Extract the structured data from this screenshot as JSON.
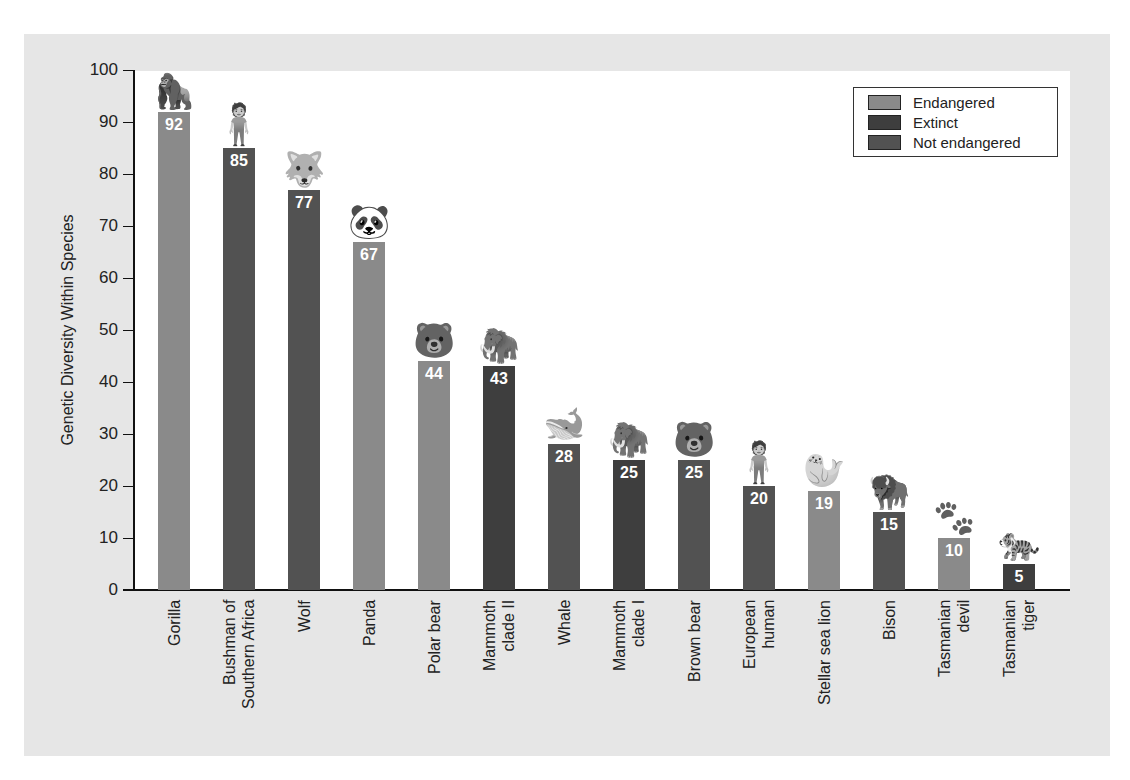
{
  "colors": {
    "Endangered": "#8a8a8a",
    "Extinct": "#3e3e3e",
    "Not endangered": "#525252"
  },
  "legend": {
    "items": [
      {
        "label": "Endangered",
        "color": "#8a8a8a"
      },
      {
        "label": "Extinct",
        "color": "#3e3e3e"
      },
      {
        "label": "Not endangered",
        "color": "#525252"
      }
    ]
  },
  "axis": {
    "ylabel": "Genetic Diversity Within Species",
    "yticks": [
      "0",
      "10",
      "20",
      "30",
      "40",
      "50",
      "60",
      "70",
      "80",
      "90",
      "100"
    ]
  },
  "chart_data": {
    "type": "bar",
    "title": "",
    "xlabel": "",
    "ylabel": "Genetic Diversity Within Species",
    "ylim": [
      0,
      100
    ],
    "yticks": [
      0,
      10,
      20,
      30,
      40,
      50,
      60,
      70,
      80,
      90,
      100
    ],
    "grid": false,
    "legend_position": "upper right",
    "categories": [
      "Gorilla",
      "Bushman of Southern Africa",
      "Wolf",
      "Panda",
      "Polar bear",
      "Mammoth clade II",
      "Whale",
      "Mammoth clade I",
      "Brown bear",
      "European human",
      "Stellar sea lion",
      "Bison",
      "Tasmanian devil",
      "Tasmanian tiger"
    ],
    "values": [
      92,
      85,
      77,
      67,
      44,
      43,
      28,
      25,
      25,
      20,
      19,
      15,
      10,
      5
    ],
    "status": [
      "Endangered",
      "Not endangered",
      "Not endangered",
      "Endangered",
      "Endangered",
      "Extinct",
      "Not endangered",
      "Extinct",
      "Not endangered",
      "Not endangered",
      "Endangered",
      "Not endangered",
      "Endangered",
      "Extinct"
    ],
    "legend": [
      "Endangered",
      "Extinct",
      "Not endangered"
    ],
    "annotations": "Value labels on each bar; animal illustration atop each bar"
  },
  "bars": [
    {
      "label_lines": [
        "Gorilla"
      ],
      "value": "92",
      "status": "Endangered",
      "icon": "gorilla-icon",
      "glyph": "🦍"
    },
    {
      "label_lines": [
        "Bushman of",
        "Southern Africa"
      ],
      "value": "85",
      "status": "Not endangered",
      "icon": "human-icon",
      "glyph": "🧍"
    },
    {
      "label_lines": [
        "Wolf"
      ],
      "value": "77",
      "status": "Not endangered",
      "icon": "wolf-icon",
      "glyph": "🐺"
    },
    {
      "label_lines": [
        "Panda"
      ],
      "value": "67",
      "status": "Endangered",
      "icon": "panda-icon",
      "glyph": "🐼"
    },
    {
      "label_lines": [
        "Polar bear"
      ],
      "value": "44",
      "status": "Endangered",
      "icon": "polar-bear-icon",
      "glyph": "🐻"
    },
    {
      "label_lines": [
        "Mammoth",
        "clade II"
      ],
      "value": "43",
      "status": "Extinct",
      "icon": "mammoth-icon",
      "glyph": "🦣"
    },
    {
      "label_lines": [
        "Whale"
      ],
      "value": "28",
      "status": "Not endangered",
      "icon": "whale-icon",
      "glyph": "🐋"
    },
    {
      "label_lines": [
        "Mammoth",
        "clade I"
      ],
      "value": "25",
      "status": "Extinct",
      "icon": "mammoth-icon",
      "glyph": "🦣"
    },
    {
      "label_lines": [
        "Brown bear"
      ],
      "value": "25",
      "status": "Not endangered",
      "icon": "brown-bear-icon",
      "glyph": "🐻"
    },
    {
      "label_lines": [
        "European",
        "human"
      ],
      "value": "20",
      "status": "Not endangered",
      "icon": "human-icon",
      "glyph": "🧍"
    },
    {
      "label_lines": [
        "Stellar sea lion"
      ],
      "value": "19",
      "status": "Endangered",
      "icon": "sea-lion-icon",
      "glyph": "🦭"
    },
    {
      "label_lines": [
        "Bison"
      ],
      "value": "15",
      "status": "Not endangered",
      "icon": "bison-icon",
      "glyph": "🦬"
    },
    {
      "label_lines": [
        "Tasmanian",
        "devil"
      ],
      "value": "10",
      "status": "Endangered",
      "icon": "tasmanian-devil-icon",
      "glyph": "🐾"
    },
    {
      "label_lines": [
        "Tasmanian",
        "tiger"
      ],
      "value": "5",
      "status": "Extinct",
      "icon": "tasmanian-tiger-icon",
      "glyph": "🐅"
    }
  ]
}
